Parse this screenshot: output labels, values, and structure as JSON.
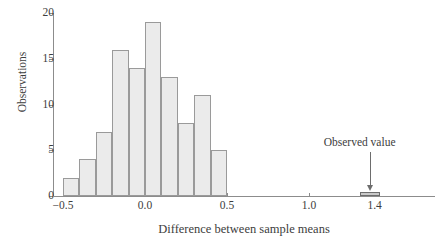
{
  "chart_data": {
    "type": "bar",
    "title": "",
    "subtitle": "",
    "xlabel": "Difference between sample means",
    "ylabel": "Observations",
    "xlim": [
      -0.55,
      1.48
    ],
    "ylim": [
      0,
      20
    ],
    "grid": false,
    "legend": null,
    "bin_width": 0.1,
    "bin_edges": [
      -0.5,
      -0.4,
      -0.3,
      -0.2,
      -0.1,
      0.0,
      0.1,
      0.2,
      0.3,
      0.4,
      0.5
    ],
    "categories": [
      "-0.5 to -0.4",
      "-0.4 to -0.3",
      "-0.3 to -0.2",
      "-0.2 to -0.1",
      "-0.1 to 0.0",
      "0.0 to 0.1",
      "0.1 to 0.2",
      "0.2 to 0.3",
      "0.3 to 0.4",
      "0.4 to 0.5"
    ],
    "values": [
      2,
      4,
      7,
      16,
      14,
      19,
      13,
      8,
      11,
      5
    ],
    "x_ticks": [
      {
        "value": -0.5,
        "label": "−0.5"
      },
      {
        "value": 0.0,
        "label": "0.0"
      },
      {
        "value": 0.5,
        "label": "0.5"
      },
      {
        "value": 1.0,
        "label": "1.0"
      },
      {
        "value": 1.4,
        "label": "1.4"
      }
    ],
    "y_ticks": [
      {
        "value": 0,
        "label": "0"
      },
      {
        "value": 5,
        "label": "5"
      },
      {
        "value": 10,
        "label": "10"
      },
      {
        "value": 15,
        "label": "15"
      },
      {
        "value": 20,
        "label": "20"
      }
    ],
    "annotations": [
      {
        "name": "observed-value",
        "label": "Observed value",
        "x": 1.37,
        "y": 0.3,
        "marker": "bar",
        "arrow": true
      }
    ],
    "colors": {
      "bar_fill": "#ebebeb",
      "bar_stroke": "#9a9a9a",
      "axis": "#8c8c8c",
      "text": "#3d3d3d",
      "observed_fill": "#c9c9c9",
      "observed_stroke": "#6d6d6d",
      "background": "#ffffff"
    }
  }
}
